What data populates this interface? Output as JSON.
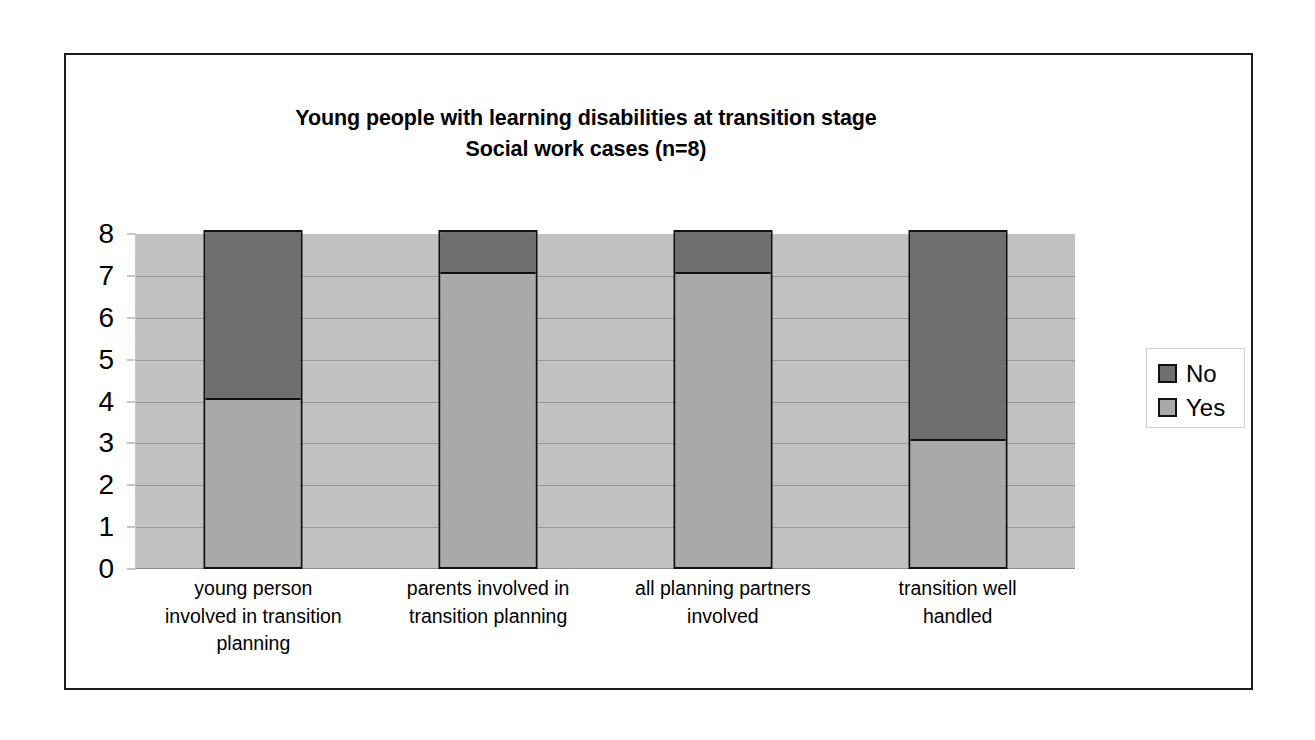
{
  "chart_data": {
    "type": "bar",
    "subtype": "stacked-column",
    "title": "Young people with learning disabilities at transition stage Social work cases (n=8)",
    "title_lines": [
      "Young people with learning disabilities at transition stage",
      "Social work cases (n=8)"
    ],
    "xlabel": "",
    "ylabel": "",
    "ylim": [
      0,
      8
    ],
    "ytick_labels": [
      "8",
      "7",
      "6",
      "5",
      "4",
      "3",
      "2",
      "1",
      "0"
    ],
    "ytick_values": [
      8,
      7,
      6,
      5,
      4,
      3,
      2,
      1,
      0
    ],
    "grid": true,
    "grid_axis": "y",
    "legend_position": "right",
    "total_n": 8,
    "categories": [
      "young person involved in transition planning",
      "parents involved in transition planning",
      "all planning partners involved",
      "transition well handled"
    ],
    "category_label_lines": [
      [
        "young person",
        "involved in transition",
        "planning"
      ],
      [
        "parents involved in",
        "transition planning"
      ],
      [
        "all planning partners",
        "involved"
      ],
      [
        "transition well",
        "handled"
      ]
    ],
    "series": [
      {
        "name": "No",
        "color": "#6f6f6f",
        "values": [
          4,
          1,
          1,
          5
        ],
        "stack_order": "top"
      },
      {
        "name": "Yes",
        "color": "#a9a9a9",
        "values": [
          4,
          7,
          7,
          3
        ],
        "stack_order": "bottom"
      }
    ],
    "stack_totals": [
      8,
      8,
      8,
      8
    ],
    "plot_background_color": "#c2c2c2",
    "frame_color": "#1a1a1a",
    "gridline_color": "#9a9a9a"
  },
  "legend": {
    "items": [
      {
        "label": "No",
        "color": "#6f6f6f"
      },
      {
        "label": "Yes",
        "color": "#a9a9a9"
      }
    ]
  }
}
